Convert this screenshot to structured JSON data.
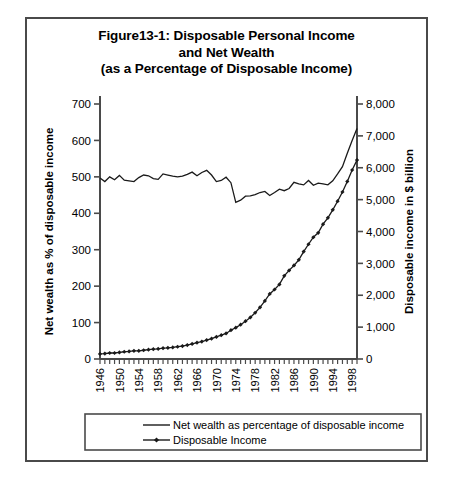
{
  "figure": {
    "title_lines": [
      "Figure13-1: Disposable Personal Income",
      "and Net Wealth",
      "(as a Percentage of Disposable Income)"
    ]
  },
  "chart_data": {
    "type": "line",
    "title": "Figure13-1: Disposable Personal Income and Net Wealth (as a Percentage of Disposable Income)",
    "xlabel": "",
    "ylabel": "Net wealth as % of disposable income",
    "y2label": "Disposable income in $ billion",
    "ylim": [
      0,
      700
    ],
    "y2lim": [
      0,
      8000
    ],
    "xlim": [
      1946,
      2000
    ],
    "grid": false,
    "legend_position": "bottom",
    "yticks": [
      0,
      100,
      200,
      300,
      400,
      500,
      600,
      700
    ],
    "ytick_labels": [
      "0",
      "100",
      "200",
      "300",
      "400",
      "500",
      "600",
      "700"
    ],
    "y2ticks": [
      0,
      1000,
      2000,
      3000,
      4000,
      5000,
      6000,
      7000,
      8000
    ],
    "y2tick_labels": [
      "0",
      "1,000",
      "2,000",
      "3,000",
      "4,000",
      "5,000",
      "6,000",
      "7,000",
      "8,000"
    ],
    "xtick_labels": [
      "1946",
      "1950",
      "1954",
      "1958",
      "1962",
      "1966",
      "1970",
      "1974",
      "1978",
      "1982",
      "1986",
      "1990",
      "1994",
      "1998"
    ],
    "x": [
      1946,
      1947,
      1948,
      1949,
      1950,
      1951,
      1952,
      1953,
      1954,
      1955,
      1956,
      1957,
      1958,
      1959,
      1960,
      1961,
      1962,
      1963,
      1964,
      1965,
      1966,
      1967,
      1968,
      1969,
      1970,
      1971,
      1972,
      1973,
      1974,
      1975,
      1976,
      1977,
      1978,
      1979,
      1980,
      1981,
      1982,
      1983,
      1984,
      1985,
      1986,
      1987,
      1988,
      1989,
      1990,
      1991,
      1992,
      1993,
      1994,
      1995,
      1996,
      1997,
      1998,
      1999
    ],
    "series": [
      {
        "name": "Net wealth as percentage of disposable income",
        "axis": "left",
        "marker": "none",
        "values": [
          497,
          487,
          500,
          492,
          504,
          491,
          489,
          487,
          498,
          505,
          503,
          495,
          493,
          508,
          505,
          502,
          500,
          502,
          507,
          513,
          503,
          512,
          518,
          505,
          487,
          490,
          499,
          484,
          430,
          436,
          447,
          448,
          451,
          457,
          460,
          449,
          457,
          466,
          462,
          468,
          485,
          481,
          478,
          490,
          477,
          483,
          481,
          478,
          489,
          508,
          528,
          565,
          600,
          633
        ]
      },
      {
        "name": "Disposable Income",
        "axis": "right",
        "marker": "diamond",
        "values": [
          160,
          170,
          189,
          189,
          207,
          227,
          239,
          256,
          257,
          275,
          292,
          308,
          318,
          340,
          350,
          364,
          385,
          405,
          438,
          473,
          512,
          547,
          594,
          637,
          692,
          746,
          802,
          903,
          983,
          1076,
          1186,
          1303,
          1451,
          1620,
          1822,
          2041,
          2180,
          2340,
          2610,
          2780,
          2935,
          3110,
          3370,
          3600,
          3820,
          3960,
          4230,
          4430,
          4680,
          4950,
          5240,
          5570,
          5930,
          6240
        ]
      }
    ],
    "legend": [
      {
        "label": "Net wealth as percentage of disposable income",
        "marker": "none"
      },
      {
        "label": "Disposable Income",
        "marker": "diamond"
      }
    ]
  }
}
